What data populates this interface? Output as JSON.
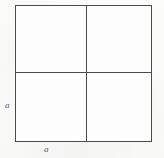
{
  "figure": {
    "kind": "geometry-diagram",
    "shape": "square",
    "subdivisions": 4,
    "colors": {
      "paper": "#fbfbfa",
      "stroke": "#4b4b4f",
      "fill": "#fdfdfd",
      "label_text": "#5a5a5e"
    },
    "square": {
      "left": 15,
      "top": 5,
      "size": 137,
      "stroke_width": 1.5
    },
    "medians": {
      "vertical_x": 85.5,
      "horizontal_y": 71.5,
      "stroke_width": 1.5
    },
    "labels": {
      "left_side": "a",
      "bottom_side": "a"
    },
    "quadrants": [
      {
        "name": "top-left"
      },
      {
        "name": "top-right"
      },
      {
        "name": "bottom-left"
      },
      {
        "name": "bottom-right"
      }
    ]
  }
}
